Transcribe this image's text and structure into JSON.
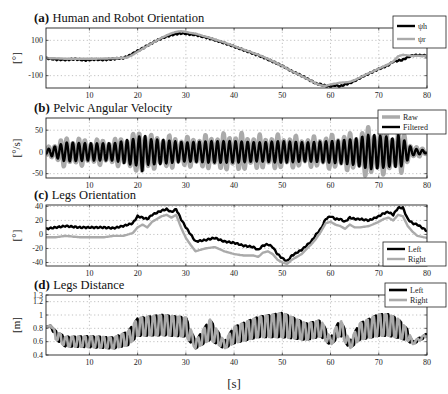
{
  "chart_data": [
    {
      "id": "a",
      "type": "line",
      "panel_label": "(a)",
      "title": "Human and Robot Orientation",
      "ylabel": "[°]",
      "xlabel": "",
      "xlim": [
        1,
        80
      ],
      "ylim": [
        -170,
        170
      ],
      "yticks": [
        100,
        0,
        -100
      ],
      "ytick_labels": [
        "100",
        "0",
        "-100"
      ],
      "xticks": [
        10,
        20,
        30,
        40,
        50,
        60,
        70,
        80
      ],
      "grid": true,
      "legend_position": "upper right outside",
      "x": [
        1,
        3,
        5,
        7,
        9,
        11,
        13,
        15,
        17,
        18,
        19,
        20,
        21,
        22,
        23,
        24,
        25,
        26,
        27,
        28,
        29,
        30,
        31,
        32,
        33,
        34,
        35,
        36,
        38,
        40,
        42,
        44,
        46,
        48,
        50,
        52,
        54,
        56,
        57,
        58,
        59,
        60,
        61,
        62,
        63,
        64,
        65,
        66,
        67,
        68,
        69,
        70,
        71,
        72,
        73,
        74,
        75,
        76,
        77,
        78,
        80
      ],
      "series": [
        {
          "name": "ψh",
          "color": "#000000",
          "width": 2.4,
          "values": [
            0,
            -8,
            -10,
            -6,
            -12,
            -8,
            -10,
            -5,
            0,
            10,
            25,
            40,
            55,
            70,
            85,
            100,
            112,
            122,
            130,
            136,
            140,
            138,
            133,
            132,
            124,
            118,
            110,
            102,
            85,
            65,
            45,
            25,
            5,
            -20,
            -45,
            -75,
            -100,
            -130,
            -145,
            -150,
            -158,
            -160,
            -155,
            -160,
            -150,
            -142,
            -130,
            -115,
            -100,
            -88,
            -75,
            -62,
            -52,
            -40,
            -20,
            -15,
            -10,
            5,
            15,
            15,
            14
          ]
        },
        {
          "name": "ψr",
          "color": "#aaaaaa",
          "width": 2.4,
          "values": [
            0,
            -2,
            -4,
            -4,
            -4,
            -4,
            -3,
            -2,
            0,
            5,
            18,
            35,
            52,
            68,
            84,
            100,
            115,
            128,
            140,
            148,
            152,
            148,
            142,
            138,
            130,
            122,
            114,
            105,
            88,
            68,
            48,
            28,
            8,
            -18,
            -45,
            -75,
            -102,
            -130,
            -145,
            -155,
            -158,
            -150,
            -145,
            -140,
            -138,
            -135,
            -125,
            -112,
            -98,
            -86,
            -74,
            -60,
            -48,
            -36,
            -20,
            10,
            18,
            15,
            12,
            12,
            12
          ]
        }
      ]
    },
    {
      "id": "b",
      "type": "line",
      "panel_label": "(b)",
      "title": "Pelvic Angular Velocity",
      "ylabel": "[°/s]",
      "xlabel": "",
      "xlim": [
        1,
        80
      ],
      "ylim": [
        -60,
        78
      ],
      "yticks": [
        50,
        0,
        -50
      ],
      "ytick_labels": [
        "50",
        "0",
        "-50"
      ],
      "xticks": [
        10,
        20,
        30,
        40,
        50,
        60,
        70,
        80
      ],
      "grid": true,
      "legend_position": "upper right outside",
      "oscillation_period_s": 1.25,
      "envelope": {
        "x": [
          1,
          5,
          10,
          15,
          18,
          20,
          21,
          22,
          25,
          30,
          35,
          40,
          45,
          50,
          55,
          60,
          65,
          68,
          70,
          72,
          73,
          74,
          75,
          77,
          80
        ],
        "raw_amplitude": [
          10,
          35,
          30,
          30,
          40,
          45,
          70,
          40,
          40,
          35,
          40,
          45,
          40,
          40,
          35,
          40,
          45,
          60,
          55,
          50,
          45,
          55,
          45,
          15,
          5
        ],
        "filtered_amplitude": [
          5,
          22,
          20,
          20,
          28,
          32,
          45,
          30,
          28,
          22,
          25,
          25,
          22,
          25,
          22,
          25,
          30,
          40,
          38,
          35,
          30,
          40,
          30,
          8,
          3
        ]
      },
      "series": [
        {
          "name": "Raw",
          "color": "#aaaaaa",
          "width": 4.5
        },
        {
          "name": "Filtered",
          "color": "#000000",
          "width": 2.4
        }
      ]
    },
    {
      "id": "c",
      "type": "line",
      "panel_label": "(c)",
      "title": "Legs Orientation",
      "ylabel": "[°]",
      "xlabel": "",
      "xlim": [
        1,
        80
      ],
      "ylim": [
        -45,
        42
      ],
      "yticks": [
        40,
        20,
        0,
        -20,
        -40
      ],
      "ytick_labels": [
        "40",
        "20",
        "0",
        "-20",
        "-40"
      ],
      "xticks": [
        10,
        20,
        30,
        40,
        50,
        60,
        70,
        80
      ],
      "grid": true,
      "legend_position": "lower right",
      "x": [
        1,
        3,
        5,
        8,
        10,
        13,
        15,
        17,
        18,
        19,
        20,
        21,
        22,
        23,
        25,
        26,
        27,
        28,
        29,
        30,
        31,
        32,
        34,
        36,
        38,
        40,
        42,
        44,
        45,
        46,
        47,
        48,
        49,
        50,
        51,
        52,
        54,
        56,
        57,
        58,
        59,
        60,
        61,
        62,
        63,
        64,
        65,
        66,
        68,
        70,
        71,
        72,
        73,
        74,
        75,
        76,
        77,
        78,
        80
      ],
      "series": [
        {
          "name": "Left",
          "color": "#000000",
          "width": 2.4,
          "values": [
            8,
            10,
            12,
            10,
            10,
            10,
            9,
            12,
            14,
            16,
            26,
            24,
            22,
            28,
            34,
            36,
            32,
            36,
            22,
            10,
            0,
            -10,
            -8,
            -5,
            -10,
            -12,
            -16,
            -18,
            -22,
            -16,
            -14,
            -18,
            -28,
            -34,
            -38,
            -30,
            -22,
            -10,
            0,
            8,
            22,
            26,
            22,
            22,
            18,
            24,
            22,
            22,
            20,
            26,
            30,
            32,
            28,
            38,
            38,
            22,
            16,
            14,
            5
          ]
        },
        {
          "name": "Right",
          "color": "#aaaaaa",
          "width": 2.4,
          "values": [
            -4,
            -4,
            -2,
            -4,
            -4,
            -4,
            -2,
            -2,
            0,
            2,
            10,
            14,
            10,
            18,
            26,
            28,
            24,
            28,
            10,
            -5,
            -15,
            -24,
            -20,
            -18,
            -24,
            -28,
            -30,
            -30,
            -32,
            -26,
            -24,
            -28,
            -36,
            -40,
            -42,
            -36,
            -28,
            -14,
            -6,
            4,
            16,
            18,
            14,
            12,
            8,
            14,
            10,
            10,
            12,
            18,
            22,
            24,
            20,
            28,
            26,
            12,
            4,
            -2,
            -5
          ]
        }
      ]
    },
    {
      "id": "d",
      "type": "line",
      "panel_label": "(d)",
      "title": "Legs Distance",
      "ylabel": "[m]",
      "xlabel": "[s]",
      "xlim": [
        1,
        80
      ],
      "ylim": [
        0.4,
        1.3
      ],
      "yticks": [
        1.3,
        1.2,
        1,
        0.8,
        0.6,
        0.4
      ],
      "ytick_labels": [
        "1.3",
        "1.2",
        "1",
        "0.8",
        "0.6",
        "0.4"
      ],
      "xticks": [
        10,
        20,
        30,
        40,
        50,
        60,
        70,
        80
      ],
      "grid": true,
      "legend_position": "upper right outside",
      "oscillation_period_s": 1.3,
      "envelope": {
        "x": [
          1,
          2,
          3,
          5,
          10,
          15,
          18,
          20,
          25,
          30,
          32,
          35,
          38,
          40,
          45,
          50,
          55,
          58,
          60,
          62,
          64,
          66,
          68,
          70,
          72,
          74,
          76,
          77,
          80
        ],
        "mean": [
          0.82,
          0.84,
          0.7,
          0.6,
          0.6,
          0.58,
          0.65,
          0.82,
          0.85,
          0.82,
          0.55,
          0.78,
          0.55,
          0.7,
          0.82,
          0.85,
          0.75,
          0.8,
          0.6,
          0.82,
          0.55,
          0.75,
          0.8,
          0.85,
          0.85,
          0.8,
          0.7,
          0.58,
          0.7
        ],
        "amplitude": [
          0,
          0,
          0.06,
          0.07,
          0.08,
          0.08,
          0.1,
          0.13,
          0.15,
          0.14,
          0.05,
          0.15,
          0.05,
          0.12,
          0.15,
          0.18,
          0.12,
          0.12,
          0.05,
          0.12,
          0.05,
          0.12,
          0.14,
          0.16,
          0.16,
          0.14,
          0.08,
          0.02,
          0.02
        ]
      },
      "series": [
        {
          "name": "Left",
          "color": "#000000",
          "width": 2.6
        },
        {
          "name": "Right",
          "color": "#aaaaaa",
          "width": 2.6
        }
      ]
    }
  ],
  "legends": {
    "a": [
      "ψh",
      "ψr"
    ],
    "b": [
      "Raw",
      "Filtered"
    ],
    "c": [
      "Left",
      "Right"
    ],
    "d": [
      "Left",
      "Right"
    ]
  },
  "xtick_labels": [
    "10",
    "20",
    "30",
    "40",
    "50",
    "60",
    "70",
    "80"
  ],
  "shared_xlabel": "[s]"
}
